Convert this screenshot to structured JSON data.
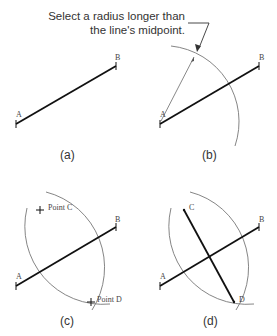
{
  "figure": {
    "callout_line1": "Select a radius longer than",
    "callout_line2": "the line's midpoint.",
    "panels": [
      {
        "caption": "(a)",
        "labels": {
          "a": "A",
          "b": "B"
        }
      },
      {
        "caption": "(b)",
        "labels": {
          "a": "A",
          "b": "B"
        }
      },
      {
        "caption": "(c)",
        "labels": {
          "a": "A",
          "b": "B",
          "c": "Point C",
          "d": "Point D"
        }
      },
      {
        "caption": "(d)",
        "labels": {
          "a": "A",
          "b": "B",
          "c": "C",
          "d": "D"
        }
      }
    ],
    "colors": {
      "line": "#111111",
      "arc": "#777777",
      "text": "#333333"
    }
  }
}
